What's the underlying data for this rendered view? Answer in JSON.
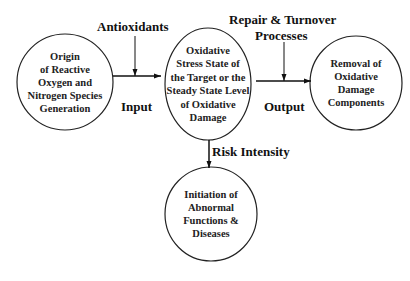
{
  "nodes": {
    "origin": {
      "lines": [
        "Origin",
        "of Reactive",
        "Oxygen and",
        "Nitrogen Species",
        "Generation"
      ]
    },
    "stress": {
      "lines": [
        "Oxidative",
        "Stress State of",
        "the Target or the",
        "Steady State Level",
        "of Oxidative",
        "Damage"
      ]
    },
    "removal": {
      "lines": [
        "Removal of",
        "Oxidative",
        "Damage",
        "Components"
      ]
    },
    "disease": {
      "lines": [
        "Initiation of",
        "Abnormal",
        "Functions &",
        "Diseases"
      ]
    }
  },
  "labels": {
    "antioxidants": "Antioxidants",
    "repair_line1": "Repair & Turnover",
    "repair_line2": "Processes",
    "input": "Input",
    "output": "Output",
    "risk": "Risk Intensity"
  }
}
